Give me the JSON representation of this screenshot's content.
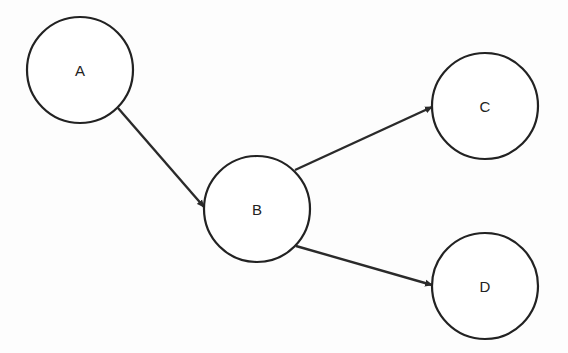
{
  "diagram": {
    "type": "directed-graph",
    "nodes": [
      {
        "id": "A",
        "label": "A",
        "cx": 80,
        "cy": 70,
        "r": 53
      },
      {
        "id": "B",
        "label": "B",
        "cx": 257,
        "cy": 209,
        "r": 53
      },
      {
        "id": "C",
        "label": "C",
        "cx": 485,
        "cy": 106,
        "r": 53
      },
      {
        "id": "D",
        "label": "D",
        "cx": 485,
        "cy": 286,
        "r": 53
      }
    ],
    "edges": [
      {
        "from": "A",
        "to": "B",
        "x1": 118,
        "y1": 108,
        "x2": 204,
        "y2": 207
      },
      {
        "from": "B",
        "to": "C",
        "x1": 295,
        "y1": 170,
        "x2": 432,
        "y2": 107
      },
      {
        "from": "B",
        "to": "D",
        "x1": 296,
        "y1": 246,
        "x2": 432,
        "y2": 285
      }
    ],
    "colors": {
      "stroke": "#222222",
      "background": "#ffffff"
    }
  }
}
